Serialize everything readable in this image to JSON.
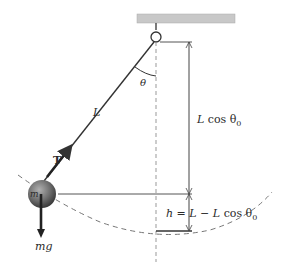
{
  "diagram": {
    "type": "simple-pendulum",
    "labels": {
      "length": "L",
      "angle": "θ",
      "tension": "T",
      "mass": "m",
      "weight": "mg",
      "vertical_height_L": "L",
      "vertical_height_cos": " cos θ",
      "vertical_height_sub": "0",
      "h_label_h": "h",
      "h_label_eq": " = ",
      "h_label_L1": "L",
      "h_label_minus": " − ",
      "h_label_L2": "L",
      "h_label_cos": " cos θ",
      "h_label_sub": "0"
    },
    "colors": {
      "ceiling": "#c8c8c8",
      "string": "#333333",
      "bob": "#6e6e6e",
      "dashed": "#999999",
      "line": "#444444"
    }
  }
}
